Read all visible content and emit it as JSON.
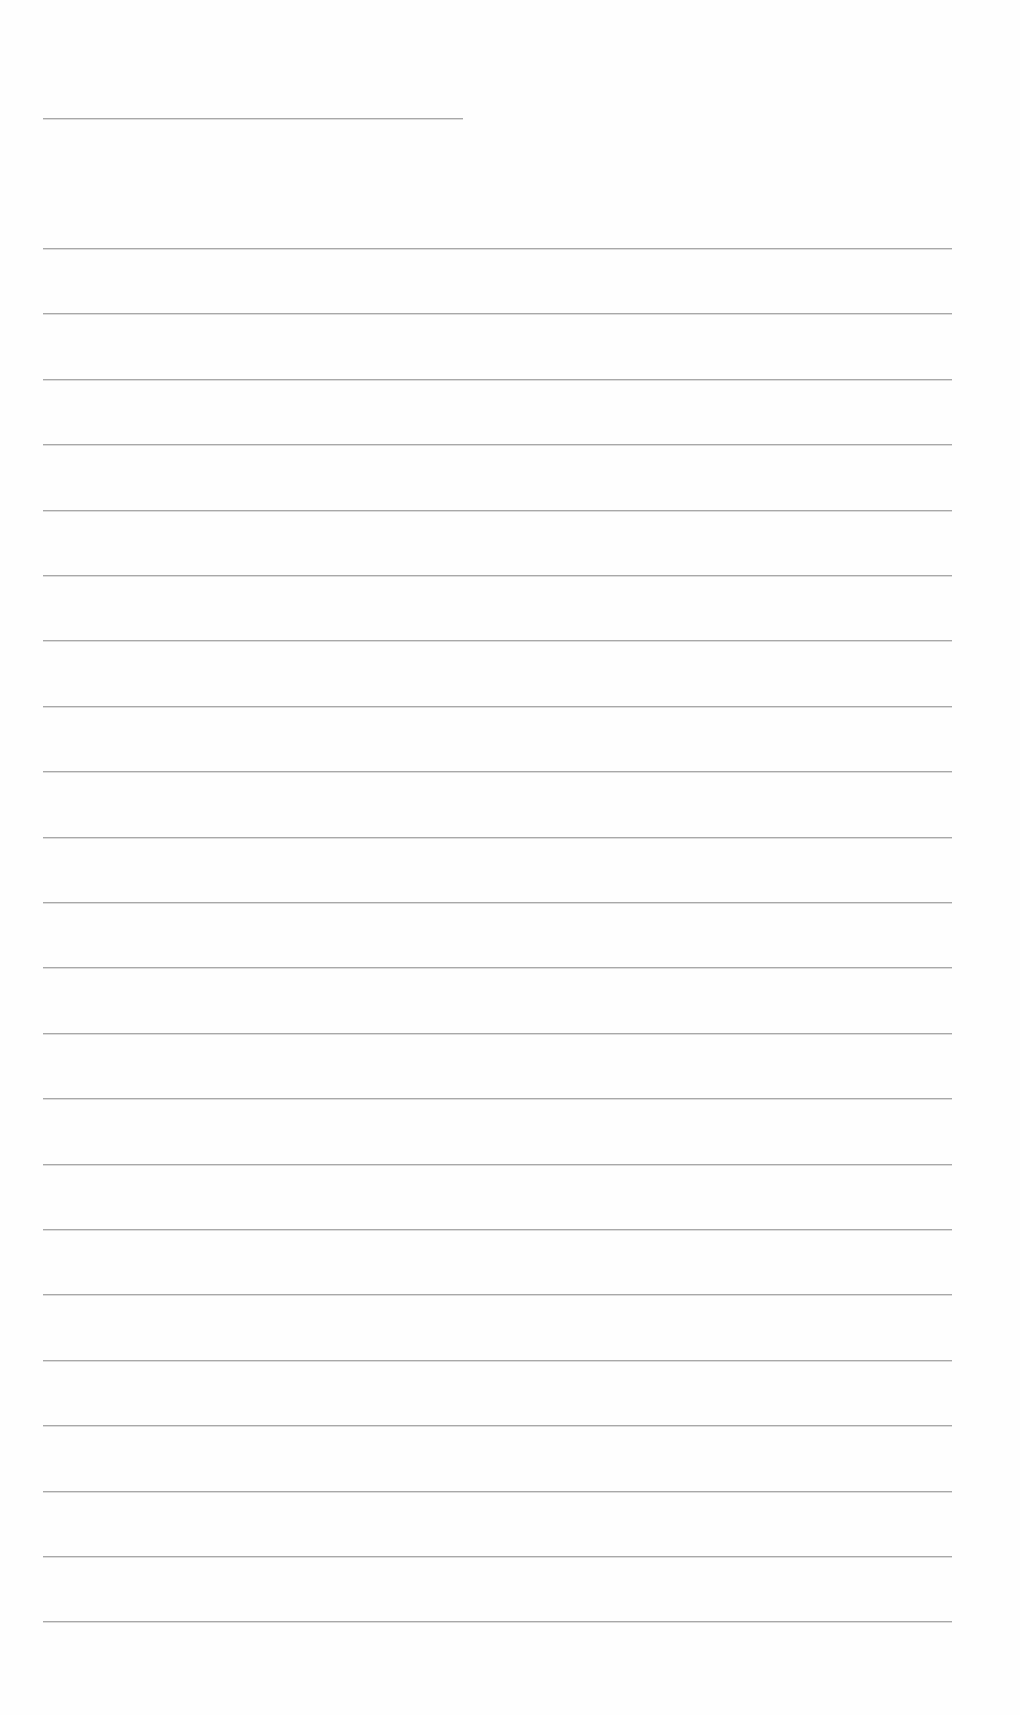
{
  "page": {
    "type": "blank lined writing sheet",
    "title_line": {
      "present": true,
      "text": ""
    },
    "lines": {
      "count": 22,
      "first_top_px": 248,
      "spacing_px": 65.4,
      "values": [
        "",
        "",
        "",
        "",
        "",
        "",
        "",
        "",
        "",
        "",
        "",
        "",
        "",
        "",
        "",
        "",
        "",
        "",
        "",
        "",
        "",
        ""
      ]
    },
    "colors": {
      "paper": "#fefefe",
      "rule": "#9a9a9a"
    }
  }
}
